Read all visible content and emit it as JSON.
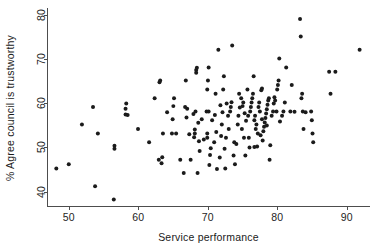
{
  "chart_data": {
    "type": "scatter",
    "title": "",
    "xlabel": "Service performance",
    "ylabel": "% Agree council is trustworthy",
    "xlim": [
      47,
      93.5
    ],
    "ylim": [
      36.5,
      81.5
    ],
    "xticks": [
      50,
      60,
      70,
      80,
      90
    ],
    "yticks": [
      40,
      50,
      60,
      70,
      80
    ],
    "grid": false,
    "legend": null,
    "marker": {
      "shape": "circle",
      "color": "#1b1b1b",
      "size": 4
    },
    "background": "#ffffff",
    "n_points": 168,
    "points": [
      [
        48.2,
        45.0
      ],
      [
        50.0,
        46.0
      ],
      [
        51.9,
        55.0
      ],
      [
        53.5,
        59.0
      ],
      [
        53.8,
        41.0
      ],
      [
        54.2,
        53.0
      ],
      [
        56.5,
        38.0
      ],
      [
        56.6,
        49.5
      ],
      [
        56.6,
        50.2
      ],
      [
        58.2,
        57.3
      ],
      [
        58.2,
        58.6
      ],
      [
        58.3,
        59.8
      ],
      [
        58.5,
        57.2
      ],
      [
        60.0,
        54.0
      ],
      [
        61.6,
        51.0
      ],
      [
        62.4,
        61.0
      ],
      [
        63.0,
        47.0
      ],
      [
        63.1,
        64.6
      ],
      [
        63.2,
        65.0
      ],
      [
        63.4,
        46.2
      ],
      [
        63.5,
        47.6
      ],
      [
        63.6,
        53.0
      ],
      [
        64.9,
        53.0
      ],
      [
        65.0,
        56.2
      ],
      [
        65.1,
        59.2
      ],
      [
        65.2,
        61.0
      ],
      [
        66.1,
        47.0
      ],
      [
        66.6,
        44.0
      ],
      [
        66.9,
        65.0
      ],
      [
        67.0,
        56.6
      ],
      [
        67.1,
        58.6
      ],
      [
        67.6,
        47.0
      ],
      [
        68.0,
        57.4
      ],
      [
        68.1,
        52.1
      ],
      [
        68.2,
        53.0
      ],
      [
        68.2,
        53.9
      ],
      [
        68.3,
        58.0
      ],
      [
        68.4,
        66.8
      ],
      [
        68.4,
        67.4
      ],
      [
        68.5,
        67.9
      ],
      [
        68.6,
        44.0
      ],
      [
        68.7,
        55.4
      ],
      [
        69.9,
        58.0
      ],
      [
        70.0,
        52.0
      ],
      [
        70.0,
        53.0
      ],
      [
        70.0,
        63.0
      ],
      [
        70.1,
        65.0
      ],
      [
        70.2,
        68.0
      ],
      [
        70.3,
        45.8
      ],
      [
        70.4,
        48.1
      ],
      [
        70.5,
        49.6
      ],
      [
        71.0,
        51.0
      ],
      [
        71.1,
        57.2
      ],
      [
        71.2,
        62.0
      ],
      [
        71.4,
        44.9
      ],
      [
        71.6,
        72.0
      ],
      [
        71.8,
        47.5
      ],
      [
        72.0,
        52.4
      ],
      [
        72.1,
        55.0
      ],
      [
        72.2,
        57.8
      ],
      [
        72.3,
        63.0
      ],
      [
        72.4,
        66.0
      ],
      [
        72.5,
        49.5
      ],
      [
        72.6,
        45.0
      ],
      [
        73.3,
        58.0
      ],
      [
        73.4,
        59.0
      ],
      [
        73.5,
        60.1
      ],
      [
        73.6,
        73.0
      ],
      [
        73.8,
        48.0
      ],
      [
        73.9,
        51.0
      ],
      [
        74.4,
        55.0
      ],
      [
        74.5,
        57.0
      ],
      [
        74.6,
        62.0
      ],
      [
        74.7,
        58.9
      ],
      [
        75.0,
        54.0
      ],
      [
        75.1,
        59.2
      ],
      [
        75.2,
        60.0
      ],
      [
        75.3,
        52.0
      ],
      [
        75.5,
        48.0
      ],
      [
        75.6,
        55.9
      ],
      [
        76.2,
        58.0
      ],
      [
        76.3,
        59.0
      ],
      [
        76.4,
        60.0
      ],
      [
        76.5,
        61.0
      ],
      [
        76.6,
        62.0
      ],
      [
        76.7,
        66.0
      ],
      [
        76.8,
        56.0
      ],
      [
        76.9,
        57.0
      ],
      [
        77.0,
        54.0
      ],
      [
        77.1,
        55.0
      ],
      [
        77.2,
        50.0
      ],
      [
        77.3,
        53.0
      ],
      [
        77.4,
        59.0
      ],
      [
        77.5,
        60.0
      ],
      [
        77.6,
        58.0
      ],
      [
        77.8,
        62.8
      ],
      [
        77.9,
        63.2
      ],
      [
        78.1,
        53.5
      ],
      [
        78.2,
        54.5
      ],
      [
        78.3,
        55.5
      ],
      [
        78.4,
        56.5
      ],
      [
        78.5,
        57.5
      ],
      [
        78.6,
        58.5
      ],
      [
        78.7,
        59.5
      ],
      [
        78.8,
        60.5
      ],
      [
        78.9,
        61.0
      ],
      [
        79.0,
        47.0
      ],
      [
        79.1,
        50.3
      ],
      [
        79.5,
        58.0
      ],
      [
        79.6,
        59.8
      ],
      [
        79.7,
        61.2
      ],
      [
        80.0,
        58.0
      ],
      [
        80.1,
        63.0
      ],
      [
        80.2,
        64.0
      ],
      [
        80.3,
        65.0
      ],
      [
        80.4,
        70.0
      ],
      [
        80.5,
        55.7
      ],
      [
        81.0,
        58.0
      ],
      [
        81.2,
        60.0
      ],
      [
        81.4,
        68.0
      ],
      [
        82.0,
        58.0
      ],
      [
        82.2,
        64.0
      ],
      [
        83.4,
        79.0
      ],
      [
        83.5,
        75.0
      ],
      [
        83.6,
        61.0
      ],
      [
        83.7,
        62.0
      ],
      [
        83.8,
        58.0
      ],
      [
        83.9,
        54.0
      ],
      [
        85.0,
        58.0
      ],
      [
        85.1,
        56.0
      ],
      [
        85.2,
        53.0
      ],
      [
        85.3,
        51.0
      ],
      [
        87.6,
        67.0
      ],
      [
        87.8,
        62.0
      ],
      [
        88.5,
        67.0
      ],
      [
        92.0,
        72.0
      ],
      [
        64.2,
        57.8
      ],
      [
        66.8,
        59.0
      ],
      [
        69.2,
        56.2
      ],
      [
        71.9,
        59.4
      ],
      [
        73.1,
        54.0
      ],
      [
        74.2,
        50.6
      ],
      [
        75.8,
        63.0
      ],
      [
        76.1,
        49.8
      ],
      [
        77.7,
        52.6
      ],
      [
        78.0,
        51.4
      ],
      [
        79.3,
        57.0
      ],
      [
        80.8,
        57.0
      ],
      [
        82.6,
        57.9
      ],
      [
        84.2,
        57.8
      ],
      [
        67.4,
        52.8
      ],
      [
        69.5,
        51.6
      ],
      [
        70.7,
        56.0
      ],
      [
        72.8,
        59.8
      ],
      [
        74.9,
        61.0
      ],
      [
        76.0,
        52.0
      ],
      [
        78.6,
        54.8
      ],
      [
        70.2,
        58.0
      ],
      [
        73.0,
        57.0
      ],
      [
        75.4,
        57.6
      ],
      [
        77.9,
        56.2
      ],
      [
        79.8,
        60.5
      ],
      [
        65.5,
        53.0
      ],
      [
        68.9,
        49.0
      ],
      [
        71.3,
        53.3
      ],
      [
        74.0,
        46.0
      ],
      [
        76.8,
        49.9
      ],
      [
        68.8,
        51.2
      ],
      [
        72.7,
        52.0
      ],
      [
        75.9,
        57.0
      ]
    ]
  }
}
